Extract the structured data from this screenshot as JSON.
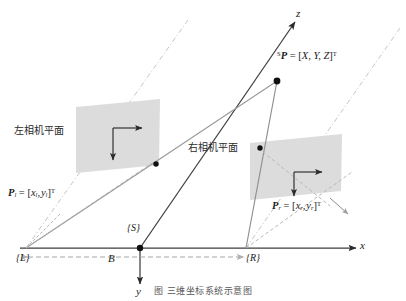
{
  "figure": {
    "title_caption": "图            三维坐标系统示意图",
    "type": "stereo-vision-geometry-diagram",
    "background": "#ffffff"
  },
  "colors": {
    "axis": "#444444",
    "ray_dark": "#2a2a2a",
    "ray_gray": "#9a9a9a",
    "plane_fill": "#d9d9d9",
    "dashdot": "#b9b9b9",
    "baseline_dash": "#9e9e9e",
    "text": "#1a1a1a"
  },
  "axes": [
    {
      "name": "x-axis",
      "label": "x",
      "direction": "right"
    },
    {
      "name": "y-axis",
      "label": "y",
      "direction": "down"
    },
    {
      "name": "z-axis",
      "label": "z",
      "direction": "up-right"
    }
  ],
  "frames": [
    {
      "name": "left-camera-frame",
      "label": "{L}"
    },
    {
      "name": "world-frame",
      "label": "{S}"
    },
    {
      "name": "right-camera-frame",
      "label": "{R}"
    }
  ],
  "baseline": {
    "label": "B",
    "name": "baseline-B"
  },
  "planes": [
    {
      "name": "left-image-plane",
      "label": "左相机平面"
    },
    {
      "name": "right-image-plane",
      "label": "右相机平面"
    }
  ],
  "points": [
    {
      "name": "world-point",
      "label_parts": {
        "sup": "S",
        "sym": "P",
        "eq": "= [",
        "vec": "X, Y, Z",
        "close": "]",
        "t": "T"
      },
      "label_plain": "ˢP = [X, Y, Z]ᵀ"
    },
    {
      "name": "left-image-point",
      "label_parts": {
        "sym": "P",
        "sub": "l",
        "eq": "= [",
        "v1": "x",
        "v1s": "l",
        "v2": "y",
        "v2s": "l",
        "close": "]",
        "t": "T"
      },
      "label_plain": "P_l = [x_l, y_l]ᵀ"
    },
    {
      "name": "right-image-point",
      "label_parts": {
        "sym": "P",
        "sub": "r",
        "eq": "= [",
        "v1": "x",
        "v1s": "r",
        "v2": "y",
        "v2s": "r",
        "close": "]",
        "t": "T"
      },
      "label_plain": "P_r = [x_r, y_r]ᵀ"
    }
  ]
}
